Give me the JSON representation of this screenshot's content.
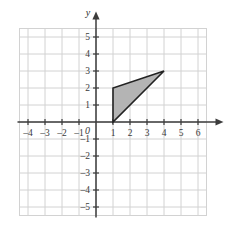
{
  "figure": {
    "background_color": "#ffffff",
    "width": 228,
    "height": 234
  },
  "chart_data": {
    "type": "scatter",
    "title": "",
    "subtitle": "",
    "xlabel": "x",
    "ylabel": "y",
    "xlim": [
      -4.5,
      6.5
    ],
    "ylim": [
      -5.5,
      5.5
    ],
    "grid": true,
    "legend": null,
    "grid_color": "#d2d2d2",
    "axis_color": "#3c3c3c",
    "x_ticks": [
      -4,
      -3,
      -2,
      -1,
      1,
      2,
      3,
      4,
      5,
      6
    ],
    "y_ticks": [
      5,
      4,
      3,
      2,
      1,
      -1,
      -2,
      -3,
      -4,
      -5
    ],
    "x_tick_labels": [
      "–4",
      "–3",
      "–2",
      "–1",
      "1",
      "2",
      "3",
      "4",
      "5",
      "6"
    ],
    "y_tick_labels": [
      "5",
      "4",
      "3",
      "2",
      "1",
      "–1",
      "–2",
      "–3",
      "–4",
      "–5"
    ],
    "origin_label": "0",
    "shapes": [
      {
        "name": "triangle",
        "kind": "polygon",
        "vertices": [
          [
            1,
            0
          ],
          [
            1,
            2
          ],
          [
            4,
            3
          ]
        ],
        "fill": "#b4b4b4",
        "stroke": "#222222",
        "stroke_width": 1.6
      }
    ]
  },
  "axis_labels": {
    "x": "x",
    "y": "y"
  }
}
